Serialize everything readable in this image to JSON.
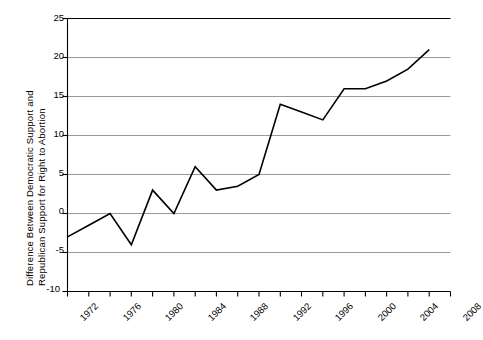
{
  "chart_data": {
    "type": "line",
    "title": "",
    "subtitle": "",
    "xlabel": "",
    "ylabel": "Difference Between Democratic Support and Republican Support for Right to Abortion",
    "ylabel_lines": [
      "Difference Between Democratic Support and",
      "Republican Support for Right to Abortion"
    ],
    "x": [
      1972,
      1974,
      1976,
      1978,
      1980,
      1982,
      1984,
      1986,
      1988,
      1990,
      1992,
      1994,
      1996,
      1998,
      2000,
      2002,
      2004,
      2006
    ],
    "values": [
      -3,
      -1.5,
      0,
      -4,
      3,
      0,
      6,
      3,
      3.5,
      5,
      14,
      13,
      12,
      16,
      16,
      17,
      18.5,
      21
    ],
    "series": [
      {
        "name": "Difference in support",
        "values": [
          -3,
          -1.5,
          0,
          -4,
          3,
          0,
          6,
          3,
          3.5,
          5,
          14,
          13,
          12,
          16,
          16,
          17,
          18.5,
          21
        ]
      }
    ],
    "xlim": [
      1972,
      2008
    ],
    "ylim": [
      -10,
      25
    ],
    "ytick_labels": [
      "25",
      "20",
      "15",
      "10",
      "5",
      "0",
      "-5",
      "-10"
    ],
    "ytick_values": [
      25,
      20,
      15,
      10,
      5,
      0,
      -5,
      -10
    ],
    "xtick_labels": [
      "1972",
      "1976",
      "1980",
      "1984",
      "1988",
      "1992",
      "1996",
      "2000",
      "2004",
      "2008"
    ],
    "xtick_values": [
      1972,
      1976,
      1980,
      1984,
      1988,
      1992,
      1996,
      2000,
      2004,
      2008
    ],
    "xminor_values": [
      1974,
      1978,
      1982,
      1986,
      1990,
      1994,
      1998,
      2002,
      2006
    ],
    "grid": {
      "horizontal": true,
      "vertical": false,
      "color": "#9a9a9a"
    },
    "legend": {
      "visible": false,
      "position": "none",
      "entries": []
    },
    "line_color": "#000000",
    "line_width": 1.6,
    "axis_color": "#000000",
    "background_color": "#ffffff"
  }
}
